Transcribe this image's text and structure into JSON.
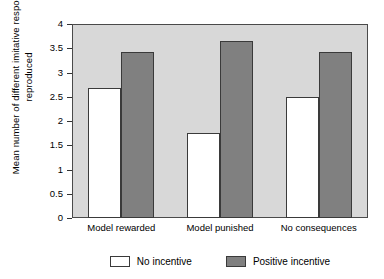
{
  "chart_data": {
    "type": "bar",
    "title": "",
    "xlabel": "",
    "ylabel": "Mean number of different imitative responses reproduced",
    "categories": [
      "Model rewarded",
      "Model punished",
      "No consequences"
    ],
    "series": [
      {
        "name": "No incentive",
        "color": "#ffffff",
        "values": [
          2.68,
          1.75,
          2.49
        ]
      },
      {
        "name": "Positive incentive",
        "color": "#808080",
        "values": [
          3.43,
          3.65,
          3.42
        ]
      }
    ],
    "ylim": [
      0,
      4
    ],
    "yticks": [
      0,
      0.5,
      1,
      1.5,
      2,
      2.5,
      3,
      3.5,
      4
    ],
    "ytick_labels": [
      "0",
      "0.5",
      "1",
      "1.5",
      "2",
      "2.5",
      "3",
      "3.5",
      "4"
    ],
    "grid": false,
    "legend_position": "bottom",
    "plot_background": "#d8d8d8"
  }
}
